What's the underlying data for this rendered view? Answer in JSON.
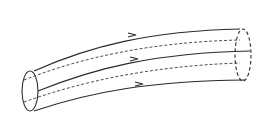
{
  "diagram": {
    "title": "",
    "colors": {
      "stroke": "#2a2a2a",
      "background": "#ffffff"
    },
    "elements": {
      "inlet_cross_section": {
        "shape": "ellipse",
        "style": "solid"
      },
      "outlet_cross_section": {
        "shape": "ellipse",
        "style": "dashed"
      },
      "streamlines_solid": 3,
      "streamlines_hidden": 2,
      "flow_arrows": 3,
      "flow_direction": "left-to-right"
    }
  }
}
